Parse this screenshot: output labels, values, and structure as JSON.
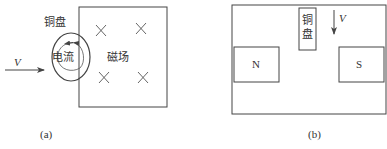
{
  "figure_a": {
    "caption": "(a)",
    "copper_disc_label": "铜盘",
    "current_label": "电流",
    "field_label": "磁场",
    "velocity_label": "V",
    "field_symbol": "×",
    "field_direction": "into-page"
  },
  "figure_b": {
    "caption": "(b)",
    "copper_disc_label_line1": "铜",
    "copper_disc_label_line2": "盘",
    "velocity_label": "V",
    "north_pole_label": "N",
    "south_pole_label": "S"
  },
  "colors": {
    "line": "#444444",
    "background": "#ffffff"
  }
}
